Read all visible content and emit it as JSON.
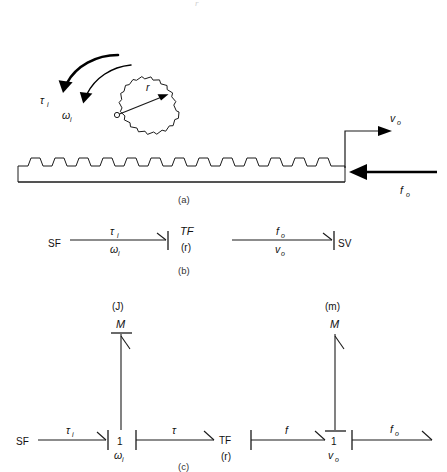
{
  "figure": {
    "title_fragment": "r",
    "background": "#ffffff",
    "ink": "#1a1a1a"
  },
  "panel_a": {
    "caption": "(a)",
    "name": "rack-and-pinion-schematic",
    "labels": {
      "torque_in": "τ",
      "torque_in_sub": "i",
      "omega_in": "ω",
      "omega_in_sub": "i",
      "radius": "r",
      "velocity_out": "v",
      "velocity_out_sub": "o",
      "force_out": "f",
      "force_out_sub": "o"
    },
    "gear": {
      "teeth": 17,
      "center_x": 136,
      "center_y": 112,
      "root_radius": 36,
      "tip_radius": 43,
      "hub_radius": 2.4
    },
    "rack": {
      "left": 18,
      "right": 345,
      "top": 158,
      "bottom": 182,
      "tooth_count": 13
    }
  },
  "panel_b": {
    "caption": "(b)",
    "name": "simple-bond-graph",
    "nodes": [
      {
        "id": "sf",
        "label": "SF",
        "x": 58,
        "y": 243
      },
      {
        "id": "tf",
        "label": "TF",
        "x": 190,
        "y": 233
      },
      {
        "id": "tf_mod",
        "label": "(r)",
        "x": 190,
        "y": 248
      },
      {
        "id": "sv",
        "label": "SV",
        "x": 353,
        "y": 243
      }
    ],
    "bonds": [
      {
        "id": "bond-left",
        "effort": "τ",
        "effort_sub": "i",
        "flow": "ω",
        "flow_sub": "i",
        "from_x": 78,
        "to_x": 170,
        "y": 240
      },
      {
        "id": "bond-right",
        "effort": "f",
        "effort_sub": "o",
        "flow": "v",
        "flow_sub": "o",
        "from_x": 232,
        "to_x": 334,
        "y": 240
      }
    ]
  },
  "panel_c": {
    "caption": "(c)",
    "name": "detailed-bond-graph",
    "nodes": [
      {
        "id": "sf",
        "label": "SF",
        "x": 26,
        "y": 442
      },
      {
        "id": "junction-1-left",
        "label": "1",
        "x": 120,
        "y": 442
      },
      {
        "id": "junction-1-left-flow",
        "label": "ω",
        "sub": "i",
        "x": 118,
        "y": 456
      },
      {
        "id": "tf",
        "label": "TF",
        "x": 230,
        "y": 440
      },
      {
        "id": "tf-mod",
        "label": "(r)",
        "x": 230,
        "y": 456
      },
      {
        "id": "junction-1-right",
        "label": "1",
        "x": 334,
        "y": 442
      },
      {
        "id": "junction-1-right-flow",
        "label": "v",
        "sub": "o",
        "x": 332,
        "y": 456
      },
      {
        "id": "inertia-J-mod",
        "label": "(J)",
        "x": 120,
        "y": 307
      },
      {
        "id": "inertia-J",
        "label": "M",
        "x": 120,
        "y": 325
      },
      {
        "id": "inertia-m-mod",
        "label": "(m)",
        "x": 334,
        "y": 307
      },
      {
        "id": "inertia-m",
        "label": "M",
        "x": 334,
        "y": 325
      }
    ],
    "bonds": [
      {
        "id": "bond-sf-to-1",
        "effort": "τ",
        "effort_sub": "i",
        "from_x": 44,
        "to_x": 112,
        "y": 440
      },
      {
        "id": "bond-1-to-tf",
        "effort": "τ",
        "effort_sub": "",
        "from_x": 140,
        "to_x": 214,
        "y": 440
      },
      {
        "id": "bond-tf-to-1",
        "effort": "f",
        "effort_sub": "",
        "from_x": 252,
        "to_x": 326,
        "y": 440
      },
      {
        "id": "bond-1-to-out",
        "effort": "f",
        "effort_sub": "o",
        "from_x": 354,
        "to_x": 432,
        "y": 440
      },
      {
        "id": "bond-1-to-J",
        "effort": "",
        "from_y": 430,
        "to_y": 333,
        "x": 120
      },
      {
        "id": "bond-1-to-m",
        "effort": "",
        "from_y": 430,
        "to_y": 333,
        "x": 334
      }
    ]
  }
}
